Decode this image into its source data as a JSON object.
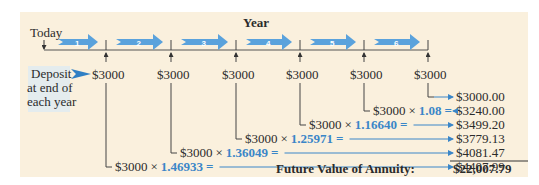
{
  "timeline": {
    "axis_label": "Year",
    "start_label": "Today",
    "years": [
      "1",
      "2",
      "3",
      "4",
      "5",
      "6"
    ]
  },
  "deposit_label": [
    "Deposit",
    "at end of",
    "each year"
  ],
  "deposits": [
    "$3000",
    "$3000",
    "$3000",
    "$3000",
    "$3000",
    "$3000"
  ],
  "colors": {
    "accent": "#3a86c8",
    "panel": "#faf0dd",
    "label_bg": "#e4ecee"
  },
  "calculations": [
    {
      "deposit": "$3000",
      "factor": "",
      "result": "$3000.00"
    },
    {
      "deposit": "$3000",
      "factor": "1.08",
      "result": "$3240.00"
    },
    {
      "deposit": "$3000",
      "factor": "1.16640",
      "result": "$3499.20"
    },
    {
      "deposit": "$3000",
      "factor": "1.25971",
      "result": "$3779.13"
    },
    {
      "deposit": "$3000",
      "factor": "1.36049",
      "result": "$4081.47"
    },
    {
      "deposit": "$3000",
      "factor": "1.46933",
      "result": "$4407.99"
    }
  ],
  "times_symbol": "×",
  "equals_symbol": "=",
  "total": {
    "label": "Future Value of Annuity:",
    "value": "$22,007.79"
  }
}
